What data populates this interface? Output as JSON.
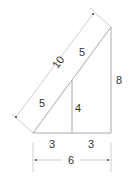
{
  "diagram": {
    "type": "similar-right-triangles",
    "labels": {
      "hypotenuse_total": "10",
      "hypotenuse_upper": "5",
      "hypotenuse_lower": "5",
      "small_height": "4",
      "large_height": "8",
      "base_left": "3",
      "base_right": "3",
      "base_total": "6"
    },
    "colors": {
      "line": "#a8a8a8",
      "text": "#333333",
      "background": "#ffffff"
    }
  }
}
